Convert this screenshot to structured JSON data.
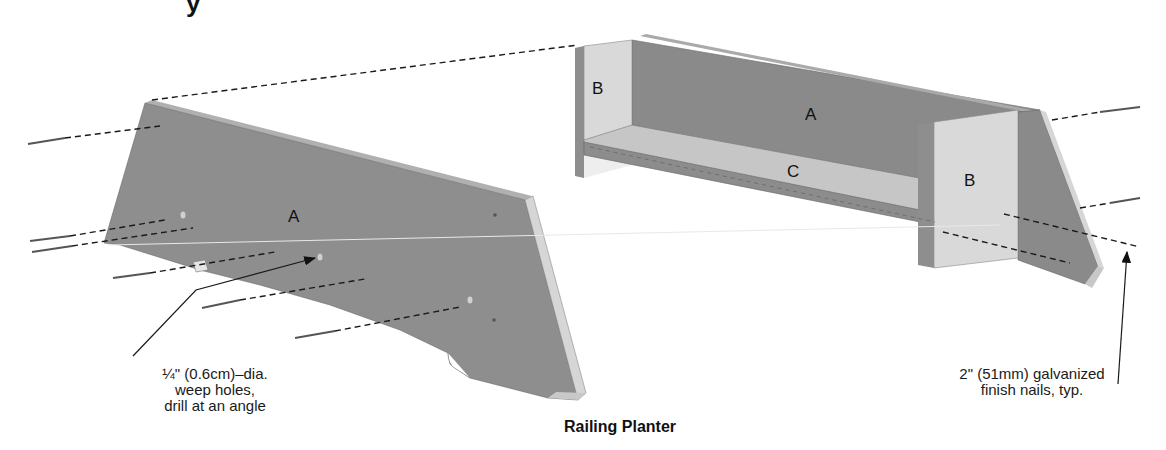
{
  "title_fragment": "y",
  "caption": "Railing Planter",
  "parts": {
    "left_side_panel": "A",
    "back_panel": "A",
    "end_left": "B",
    "end_right": "B",
    "bottom": "C"
  },
  "annotations": {
    "weep_holes": {
      "lines": [
        "¼\" (0.6cm)–dia.",
        "weep holes,",
        "drill at an angle"
      ]
    },
    "nails": {
      "lines": [
        "2\" (51mm) galvanized",
        "finish nails, typ."
      ]
    }
  },
  "colors": {
    "panel_dark": "#8e8e8e",
    "panel_mid": "#9a9a9a",
    "panel_light": "#d8d8d8",
    "edge": "#b8b8b8",
    "line": "#1a1a1a"
  }
}
